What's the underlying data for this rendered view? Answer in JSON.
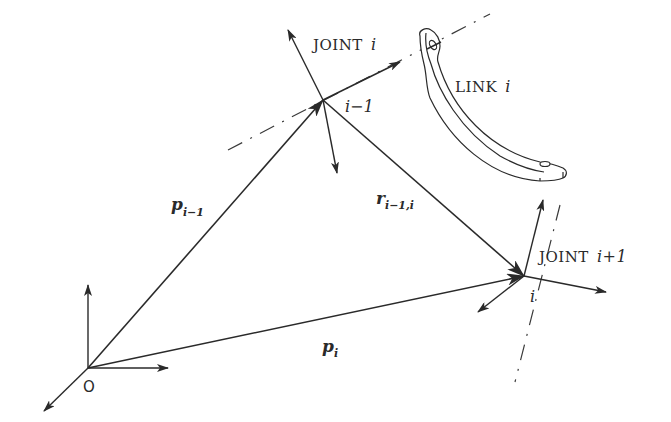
{
  "diagram": {
    "labels": {
      "joint_i": {
        "prefix": "JOINT",
        "index": "i"
      },
      "joint_i_plus_1": {
        "prefix": "JOINT",
        "index": "i+1"
      },
      "link_i": {
        "prefix": "LINK",
        "index": "i"
      },
      "frame_i_minus_1": "i−1",
      "frame_i": "i",
      "origin": "O",
      "p_i_minus_1": {
        "symbol": "p",
        "subscript": "i−1"
      },
      "r_i_minus_1_i": {
        "symbol": "r",
        "subscript": "i−1,i"
      },
      "p_i": {
        "symbol": "p",
        "subscript": "i"
      }
    },
    "nodes": [
      {
        "id": "O",
        "x": 88,
        "y": 368,
        "label": "O"
      },
      {
        "id": "frame_i_minus_1",
        "x": 323,
        "y": 100,
        "label": "i−1"
      },
      {
        "id": "frame_i",
        "x": 524,
        "y": 276,
        "label": "i"
      }
    ],
    "vectors": [
      {
        "id": "p_i_minus_1",
        "from": "O",
        "to": "frame_i_minus_1",
        "label": "p_{i-1}"
      },
      {
        "id": "r_i_minus_1_i",
        "from": "frame_i_minus_1",
        "to": "frame_i",
        "label": "r_{i-1,i}"
      },
      {
        "id": "p_i",
        "from": "O",
        "to": "frame_i",
        "label": "p_i"
      }
    ],
    "axes_lines": [
      {
        "id": "joint_i_axis",
        "type": "dash-dot",
        "through": "frame_i_minus_1"
      },
      {
        "id": "joint_i_plus_1_axis",
        "type": "dash-dot",
        "through": "frame_i"
      }
    ],
    "colors": {
      "ink": "#2a2a2a",
      "background": "#ffffff"
    }
  }
}
